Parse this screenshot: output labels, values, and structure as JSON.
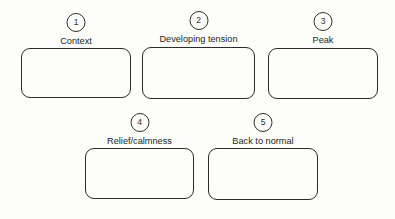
{
  "diagram": {
    "stroke_color": "#2b2b2b",
    "text_color": "#231f20",
    "background_color": "#fdfdfc",
    "steps": [
      {
        "number": "1",
        "label": "Context",
        "box_value": ""
      },
      {
        "number": "2",
        "label": "Developing tension",
        "box_value": ""
      },
      {
        "number": "3",
        "label": "Peak",
        "box_value": ""
      },
      {
        "number": "4",
        "label": "Relief/calmness",
        "box_value": ""
      },
      {
        "number": "5",
        "label": "Back to normal",
        "box_value": ""
      }
    ]
  }
}
